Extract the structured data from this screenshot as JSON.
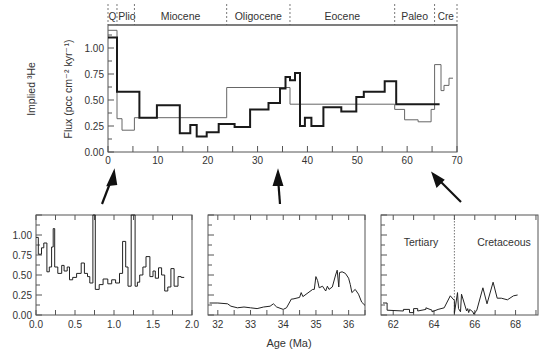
{
  "chart_data": [
    {
      "id": "main",
      "type": "line",
      "title": "",
      "xlabel": "",
      "ylabel": "Implied 3He Flux (pcc cm-2 kyr-1)",
      "ylabel_line1": "Implied ³He",
      "ylabel_line2": "Flux (pcc cm⁻² kyr⁻¹)",
      "xlim": [
        0,
        70
      ],
      "ylim": [
        0,
        1.25
      ],
      "xticks": [
        0,
        10,
        20,
        30,
        40,
        50,
        60,
        70
      ],
      "yticks": [
        0.0,
        0.25,
        0.5,
        0.75,
        1.0
      ],
      "ytick_labels": [
        "0.00",
        "0.25",
        "0.50",
        "0.75",
        "1.00"
      ],
      "grid": false,
      "epochs": [
        {
          "label": "Q",
          "start": 0,
          "end": 1.8
        },
        {
          "label": "Plio",
          "start": 1.8,
          "end": 5.3
        },
        {
          "label": "Miocene",
          "start": 5.3,
          "end": 23.8
        },
        {
          "label": "Oligocene",
          "start": 23.8,
          "end": 36.5
        },
        {
          "label": "Eocene",
          "start": 36.5,
          "end": 57.5
        },
        {
          "label": "Paleo",
          "start": 57.5,
          "end": 65.5
        },
        {
          "label": "Cre",
          "start": 65.5,
          "end": 70
        }
      ],
      "series": [
        {
          "name": "high-resolution averaged (thick)",
          "style": "thick",
          "step_x": [
            0,
            0.4,
            0.8,
            1.2,
            1.5,
            1.8,
            6.3,
            6.3,
            9.8,
            9.8,
            14.4,
            14.4,
            16.5,
            16.5,
            17.8,
            17.8,
            19.8,
            19.8,
            22.2,
            22.2,
            25.4,
            25.4,
            28.5,
            28.5,
            32.2,
            32.2,
            34.5,
            34.5,
            35.6,
            35.6,
            36.5,
            36.5,
            37.5,
            37.5,
            38.5,
            38.5,
            39.5,
            39.5,
            40.8,
            40.8,
            43.2,
            43.2,
            46.8,
            46.8,
            49.8,
            49.8,
            51.3,
            51.3,
            55.5,
            55.5,
            57.8,
            57.8,
            66.5
          ],
          "step_y": [
            1.2,
            1.03,
            0.85,
            0.68,
            0.62,
            0.58,
            0.58,
            0.33,
            0.33,
            0.45,
            0.45,
            0.18,
            0.18,
            0.26,
            0.26,
            0.15,
            0.15,
            0.19,
            0.19,
            0.27,
            0.27,
            0.24,
            0.24,
            0.41,
            0.41,
            0.47,
            0.47,
            0.61,
            0.61,
            0.72,
            0.72,
            0.69,
            0.69,
            0.76,
            0.76,
            0.25,
            0.25,
            0.33,
            0.33,
            0.25,
            0.25,
            0.43,
            0.43,
            0.39,
            0.39,
            0.53,
            0.53,
            0.58,
            0.58,
            0.68,
            0.68,
            0.65,
            0.65,
            0.46,
            0.46,
            0.49,
            0.49
          ],
          "values": [
            {
              "x0": 0,
              "x1": 1.8,
              "y": 1.1
            },
            {
              "x0": 1.8,
              "x1": 6.3,
              "y": 0.58
            },
            {
              "x0": 6.3,
              "x1": 9.8,
              "y": 0.33
            },
            {
              "x0": 9.8,
              "x1": 14.4,
              "y": 0.45
            },
            {
              "x0": 14.4,
              "x1": 16.5,
              "y": 0.18
            },
            {
              "x0": 16.5,
              "x1": 17.8,
              "y": 0.26
            },
            {
              "x0": 17.8,
              "x1": 19.8,
              "y": 0.15
            },
            {
              "x0": 19.8,
              "x1": 22.2,
              "y": 0.19
            },
            {
              "x0": 22.2,
              "x1": 25.4,
              "y": 0.27
            },
            {
              "x0": 25.4,
              "x1": 28.5,
              "y": 0.24
            },
            {
              "x0": 28.5,
              "x1": 32.2,
              "y": 0.41
            },
            {
              "x0": 32.2,
              "x1": 34.5,
              "y": 0.47
            },
            {
              "x0": 34.5,
              "x1": 35.6,
              "y": 0.61
            },
            {
              "x0": 35.6,
              "x1": 36.5,
              "y": 0.72
            },
            {
              "x0": 36.5,
              "x1": 37.5,
              "y": 0.69
            },
            {
              "x0": 37.5,
              "x1": 38.5,
              "y": 0.76
            },
            {
              "x0": 38.5,
              "x1": 39.5,
              "y": 0.25
            },
            {
              "x0": 39.5,
              "x1": 40.8,
              "y": 0.33
            },
            {
              "x0": 40.8,
              "x1": 43.2,
              "y": 0.25
            },
            {
              "x0": 43.2,
              "x1": 46.8,
              "y": 0.43
            },
            {
              "x0": 46.8,
              "x1": 49.8,
              "y": 0.39
            },
            {
              "x0": 49.8,
              "x1": 51.3,
              "y": 0.53
            },
            {
              "x0": 51.3,
              "x1": 55.5,
              "y": 0.58
            },
            {
              "x0": 55.5,
              "x1": 57.8,
              "y": 0.68
            },
            {
              "x0": 57.8,
              "x1": 66.5,
              "y": 0.46
            }
          ]
        },
        {
          "name": "epoch averaged (thin)",
          "style": "thin",
          "values": [
            {
              "x0": 0,
              "x1": 1.8,
              "y": 1.17
            },
            {
              "x0": 1.8,
              "x1": 2.8,
              "y": 0.32
            },
            {
              "x0": 2.8,
              "x1": 5.3,
              "y": 0.21
            },
            {
              "x0": 5.3,
              "x1": 23.8,
              "y": 0.33
            },
            {
              "x0": 23.8,
              "x1": 36.5,
              "y": 0.62
            },
            {
              "x0": 36.5,
              "x1": 57.5,
              "y": 0.46
            },
            {
              "x0": 57.5,
              "x1": 59.5,
              "y": 0.41
            },
            {
              "x0": 59.5,
              "x1": 62.2,
              "y": 0.31
            },
            {
              "x0": 62.2,
              "x1": 64.8,
              "y": 0.29
            },
            {
              "x0": 64.8,
              "x1": 65.5,
              "y": 0.41
            },
            {
              "x0": 65.5,
              "x1": 66.8,
              "y": 0.84
            },
            {
              "x0": 66.8,
              "x1": 67.4,
              "y": 0.59
            },
            {
              "x0": 67.4,
              "x1": 68.4,
              "y": 0.64
            },
            {
              "x0": 68.4,
              "x1": 69.2,
              "y": 0.71
            }
          ]
        }
      ]
    },
    {
      "id": "inset-0-2",
      "type": "line",
      "xlim": [
        0,
        2
      ],
      "ylim": [
        0,
        1.25
      ],
      "xticks": [
        0.0,
        0.5,
        1.0,
        1.5,
        2.0
      ],
      "xtick_labels": [
        "0.0",
        "0.5",
        "1.0",
        "1.5",
        "2.0"
      ],
      "yticks": [
        0.0,
        0.25,
        0.5,
        0.75,
        1.0
      ],
      "ytick_labels": [
        "0.00",
        "0.25",
        "0.50",
        "0.75",
        "1.00"
      ],
      "series": [
        {
          "name": "0-2 Ma",
          "x": [
            0,
            0.03,
            0.03,
            0.07,
            0.07,
            0.1,
            0.1,
            0.14,
            0.14,
            0.17,
            0.17,
            0.2,
            0.2,
            0.22,
            0.22,
            0.24,
            0.24,
            0.28,
            0.28,
            0.33,
            0.33,
            0.36,
            0.36,
            0.4,
            0.4,
            0.43,
            0.43,
            0.47,
            0.47,
            0.52,
            0.52,
            0.58,
            0.58,
            0.62,
            0.62,
            0.66,
            0.66,
            0.69,
            0.69,
            0.73,
            0.73,
            0.76,
            0.76,
            0.81,
            0.81,
            0.86,
            0.86,
            0.92,
            0.92,
            0.97,
            0.97,
            1.02,
            1.02,
            1.07,
            1.07,
            1.11,
            1.11,
            1.15,
            1.15,
            1.18,
            1.18,
            1.22,
            1.22,
            1.27,
            1.27,
            1.3,
            1.3,
            1.33,
            1.33,
            1.37,
            1.37,
            1.41,
            1.41,
            1.46,
            1.46,
            1.5,
            1.5,
            1.53,
            1.53,
            1.57,
            1.57,
            1.61,
            1.61,
            1.65,
            1.65,
            1.69,
            1.69,
            1.73,
            1.73,
            1.77,
            1.77,
            1.82,
            1.82,
            1.86,
            1.86,
            1.9
          ],
          "y": [
            0.97,
            0.97,
            0.76,
            0.76,
            0.84,
            0.84,
            0.9,
            0.9,
            0.54,
            0.54,
            0.6,
            0.6,
            0.85,
            0.85,
            1.08,
            1.08,
            0.6,
            0.6,
            0.52,
            0.52,
            0.62,
            0.62,
            0.55,
            0.55,
            0.6,
            0.6,
            0.44,
            0.44,
            0.47,
            0.47,
            0.52,
            0.52,
            0.65,
            0.65,
            0.52,
            0.52,
            0.48,
            0.48,
            0.4,
            0.4,
            1.3,
            1.3,
            0.32,
            0.32,
            0.38,
            0.38,
            0.45,
            0.45,
            0.39,
            0.39,
            0.44,
            0.44,
            0.4,
            0.4,
            0.52,
            0.52,
            0.92,
            0.92,
            0.6,
            0.6,
            0.36,
            0.36,
            1.3,
            1.3,
            0.36,
            0.36,
            0.41,
            0.41,
            0.5,
            0.5,
            0.6,
            0.6,
            0.73,
            0.73,
            0.48,
            0.48,
            0.55,
            0.55,
            0.46,
            0.46,
            0.59,
            0.59,
            0.5,
            0.5,
            0.3,
            0.3,
            0.35,
            0.35,
            0.58,
            0.58,
            0.36,
            0.36,
            0.48,
            0.48,
            0.47,
            0.47
          ]
        }
      ]
    },
    {
      "id": "inset-32-36",
      "type": "line",
      "xlabel": "Age (Ma)",
      "xlim": [
        31.7,
        36.5
      ],
      "ylim": [
        0,
        1.25
      ],
      "xticks": [
        32,
        33,
        34,
        35,
        36
      ],
      "xtick_labels": [
        "32",
        "33",
        "34",
        "35",
        "36"
      ],
      "series": [
        {
          "name": "32-36 Ma",
          "x": [
            31.75,
            32.0,
            32.3,
            32.4,
            32.6,
            32.8,
            33.0,
            33.2,
            33.4,
            33.6,
            33.7,
            33.8,
            34.0,
            34.1,
            34.25,
            34.3,
            34.5,
            34.55,
            34.6,
            34.9,
            34.95,
            35.0,
            35.05,
            35.1,
            35.2,
            35.3,
            35.35,
            35.4,
            35.5,
            35.6,
            35.65,
            35.7,
            35.72,
            35.8,
            35.9,
            36.0,
            36.05,
            36.1,
            36.2,
            36.3,
            36.4,
            36.5
          ],
          "y": [
            0.15,
            0.15,
            0.14,
            0.11,
            0.09,
            0.1,
            0.09,
            0.08,
            0.1,
            0.11,
            0.14,
            0.1,
            0.07,
            0.09,
            0.2,
            0.2,
            0.22,
            0.28,
            0.23,
            0.32,
            0.32,
            0.48,
            0.43,
            0.34,
            0.36,
            0.3,
            0.36,
            0.32,
            0.35,
            0.5,
            0.56,
            0.35,
            0.53,
            0.54,
            0.52,
            0.46,
            0.38,
            0.28,
            0.32,
            0.26,
            0.16,
            0.12
          ]
        }
      ]
    },
    {
      "id": "inset-62-68",
      "type": "line",
      "xlim": [
        61.4,
        69.1
      ],
      "ylim": [
        0,
        1.25
      ],
      "xticks": [
        62,
        64,
        66,
        68
      ],
      "xtick_labels": [
        "62",
        "64",
        "66",
        "68"
      ],
      "boundary": 65.0,
      "annotations": [
        "Tertiary",
        "Cretaceous"
      ],
      "series": [
        {
          "name": "62-68 Ma",
          "x": [
            61.5,
            61.7,
            61.7,
            62.5,
            62.5,
            62.8,
            62.8,
            63.0,
            63.0,
            63.2,
            63.2,
            63.6,
            63.6,
            63.9,
            63.9,
            64.2,
            64.2,
            64.5,
            64.5,
            64.8,
            64.8,
            65.0,
            65.0,
            65.15,
            65.2,
            65.3,
            65.35,
            65.6,
            65.65,
            65.7,
            65.75,
            65.9,
            65.95,
            66.1,
            66.1,
            66.4,
            66.4,
            66.6,
            66.6,
            66.9,
            66.9,
            67.1,
            67.1,
            67.3,
            67.3,
            67.6,
            67.6,
            67.9,
            67.9,
            68.1
          ],
          "y": [
            0.15,
            0.15,
            0.06,
            0.05,
            0.07,
            0.07,
            0.03,
            0.03,
            0.08,
            0.08,
            0.05,
            0.07,
            0.09,
            0.06,
            0.04,
            0.07,
            0.07,
            0.09,
            0.09,
            0.24,
            0.24,
            0.18,
            0.02,
            0.28,
            0.08,
            0.04,
            0.26,
            0.05,
            0.08,
            0.03,
            0.07,
            0.04,
            0.01,
            0.06,
            0.06,
            0.34,
            0.34,
            0.14,
            0.14,
            0.41,
            0.41,
            0.21,
            0.21,
            0.21,
            0.21,
            0.19,
            0.19,
            0.24,
            0.24,
            0.25
          ]
        }
      ]
    }
  ],
  "labels": {
    "ylabel_line1": "Implied ³He",
    "ylabel_line2": "Flux (pcc cm⁻² kyr⁻¹)",
    "age_label": "Age (Ma)",
    "tertiary": "Tertiary",
    "cretaceous": "Cretaceous"
  },
  "colors": {
    "axis": "#444444",
    "thick_line": "#1a1a1a",
    "thin_line": "#666666",
    "text": "#333333",
    "arrow": "#111111"
  }
}
